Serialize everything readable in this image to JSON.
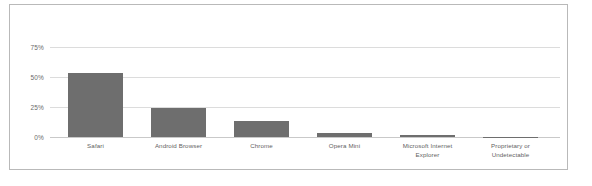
{
  "chart_data": {
    "type": "bar",
    "title": "",
    "xlabel": "",
    "ylabel": "",
    "categories": [
      "Safari",
      "Android Browser",
      "Chrome",
      "Opera Mini",
      "Microsoft Internet Explorer",
      "Proprietary or Undetectable"
    ],
    "values": [
      53,
      24,
      13,
      3.5,
      1.5,
      0.3
    ],
    "ylim": [
      0,
      75
    ],
    "yticks": [
      0,
      25,
      50,
      75
    ],
    "ytick_labels": [
      "0%",
      "25%",
      "50%",
      "75%"
    ],
    "grid": true,
    "legend": "none",
    "bar_color": "#6e6e6e",
    "gridline_color": "#dcdcdc",
    "frame_color": "#b9b9b9",
    "background_color": "#ffffff"
  }
}
